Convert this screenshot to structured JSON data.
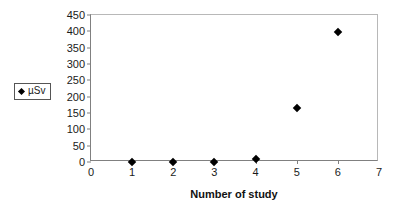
{
  "chart_data": {
    "type": "scatter",
    "title": "",
    "xlabel": "Number of study",
    "ylabel": "",
    "xlim": [
      0,
      7
    ],
    "ylim": [
      0,
      450
    ],
    "x_ticks": [
      0,
      1,
      2,
      3,
      4,
      5,
      6,
      7
    ],
    "y_ticks": [
      0,
      50,
      100,
      150,
      200,
      250,
      300,
      350,
      400,
      450
    ],
    "grid": false,
    "legend_position": "left-outside",
    "series": [
      {
        "name": "µSv",
        "marker": "diamond",
        "color": "#000000",
        "x": [
          1,
          2,
          3,
          4,
          5,
          6
        ],
        "values": [
          1,
          1,
          1,
          8,
          165,
          397
        ]
      }
    ]
  },
  "legend": {
    "marker_name": "diamond-marker",
    "label": "µSv"
  },
  "axes": {
    "x_title": "Number of study",
    "frame_color": "#b8b8b8",
    "axis_color": "#808080"
  }
}
